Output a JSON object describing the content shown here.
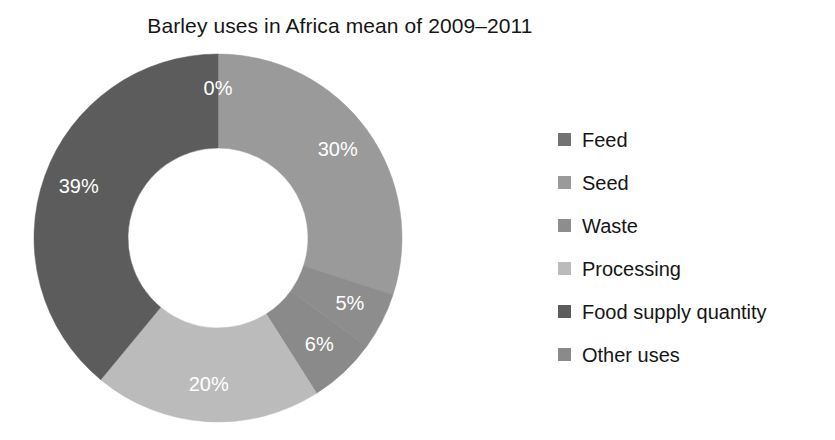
{
  "chart_data": {
    "type": "pie",
    "variant": "donut",
    "title": "Barley uses in Africa mean of 2009–2011",
    "xlabel": "",
    "ylabel": "",
    "categories": [
      "Feed",
      "Seed",
      "Waste",
      "Other uses",
      "Processing",
      "Food supply quantity"
    ],
    "values": [
      0,
      30,
      5,
      6,
      20,
      39
    ],
    "labels": [
      "0%",
      "30%",
      "5%",
      "6%",
      "20%",
      "39%"
    ],
    "colors": [
      "#737373",
      "#9a9a9a",
      "#8d8d8d",
      "#8a8a8a",
      "#bbbbbb",
      "#5c5c5c"
    ],
    "label_color": "#ffffff",
    "units": "percent",
    "start_angle_deg": 0,
    "direction": "clockwise",
    "inner_radius_ratio": 0.49,
    "grid": false,
    "legend_position": "right",
    "legend": [
      {
        "label": "Feed",
        "color": "#737373"
      },
      {
        "label": "Seed",
        "color": "#9a9a9a"
      },
      {
        "label": "Waste",
        "color": "#8d8d8d"
      },
      {
        "label": "Processing",
        "color": "#bbbbbb"
      },
      {
        "label": "Food supply quantity",
        "color": "#5c5c5c"
      },
      {
        "label": "Other uses",
        "color": "#8a8a8a"
      }
    ]
  },
  "geometry": {
    "cx": 218,
    "cy": 238,
    "outer_r": 184,
    "inner_r": 90,
    "label_r": 148
  }
}
